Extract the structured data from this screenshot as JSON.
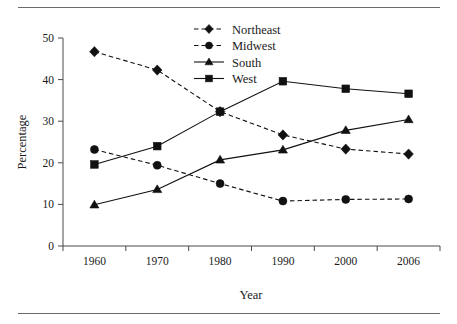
{
  "figure": {
    "rule_top": "horizontal-rule",
    "rule_bottom": "horizontal-rule"
  },
  "chart_data": {
    "type": "line",
    "title": "",
    "xlabel": "Year",
    "ylabel": "Percentage",
    "categories": [
      "1960",
      "1970",
      "1980",
      "1990",
      "2000",
      "2006"
    ],
    "x": [
      1960,
      1970,
      1980,
      1990,
      2000,
      2006
    ],
    "ylim": [
      0,
      50
    ],
    "yticks": [
      0,
      10,
      20,
      30,
      40,
      50
    ],
    "ytick_labels": [
      "0",
      "10",
      "20",
      "30",
      "40",
      "50"
    ],
    "xtick_labels": [
      "1960",
      "1970",
      "1980",
      "1990",
      "2000",
      "2006"
    ],
    "grid": false,
    "legend_position": "top-center",
    "series": [
      {
        "name": "Northeast",
        "marker": "diamond",
        "linestyle": "dashed",
        "color": "#111111",
        "values": [
          46.7,
          42.3,
          32.3,
          26.7,
          23.3,
          22.1
        ]
      },
      {
        "name": "Midwest",
        "marker": "circle",
        "linestyle": "dashed",
        "color": "#111111",
        "values": [
          23.2,
          19.4,
          15.0,
          10.8,
          11.2,
          11.3
        ]
      },
      {
        "name": "South",
        "marker": "triangle",
        "linestyle": "solid",
        "color": "#111111",
        "values": [
          9.9,
          13.6,
          20.7,
          23.1,
          27.8,
          30.4
        ]
      },
      {
        "name": "West",
        "marker": "square",
        "linestyle": "solid",
        "color": "#111111",
        "values": [
          19.6,
          24.0,
          32.3,
          39.6,
          37.8,
          36.6
        ]
      }
    ]
  }
}
